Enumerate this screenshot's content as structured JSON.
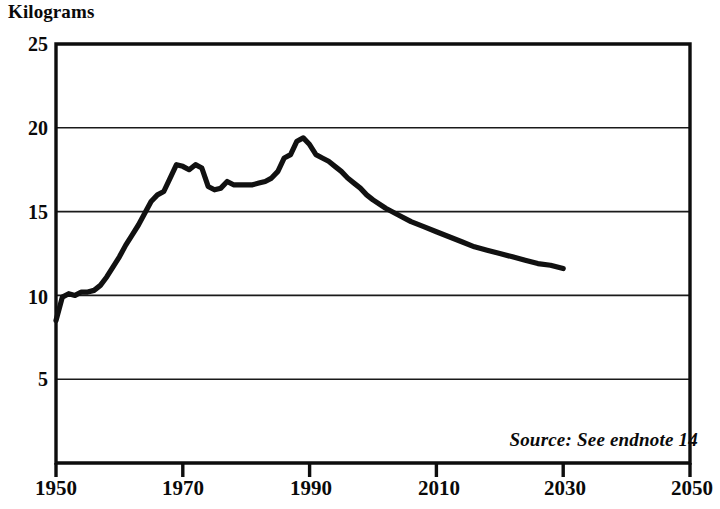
{
  "chart_data": {
    "type": "line",
    "title": "",
    "ylabel": "Kilograms",
    "xlabel": "",
    "ylim": [
      0,
      25
    ],
    "xlim": [
      1950,
      2050
    ],
    "yticks": [
      25,
      20,
      15,
      10,
      5
    ],
    "xticks": [
      1950,
      1970,
      1990,
      2010,
      2030,
      2050
    ],
    "grid": "horizontal",
    "legend": "none",
    "annotations": [
      "Source: See endnote 14"
    ],
    "line_color": "#111111",
    "series": [
      {
        "name": "Kilograms",
        "x": [
          1950,
          1951,
          1952,
          1953,
          1954,
          1955,
          1956,
          1957,
          1958,
          1959,
          1960,
          1961,
          1962,
          1963,
          1964,
          1965,
          1966,
          1967,
          1968,
          1969,
          1970,
          1971,
          1972,
          1973,
          1974,
          1975,
          1976,
          1977,
          1978,
          1979,
          1980,
          1981,
          1982,
          1983,
          1984,
          1985,
          1986,
          1987,
          1988,
          1989,
          1990,
          1991,
          1992,
          1993,
          1994,
          1995,
          1996,
          1997,
          1998,
          1999,
          2000,
          2002,
          2004,
          2006,
          2008,
          2010,
          2012,
          2014,
          2016,
          2018,
          2020,
          2022,
          2024,
          2026,
          2028,
          2030
        ],
        "y": [
          8.5,
          9.9,
          10.1,
          10.0,
          10.2,
          10.2,
          10.3,
          10.6,
          11.1,
          11.7,
          12.3,
          13.0,
          13.6,
          14.2,
          14.9,
          15.6,
          16.0,
          16.2,
          17.0,
          17.8,
          17.7,
          17.5,
          17.8,
          17.6,
          16.5,
          16.3,
          16.4,
          16.8,
          16.6,
          16.6,
          16.6,
          16.6,
          16.7,
          16.8,
          17.0,
          17.4,
          18.2,
          18.4,
          19.2,
          19.4,
          19.0,
          18.4,
          18.2,
          18.0,
          17.7,
          17.4,
          17.0,
          16.7,
          16.4,
          16.0,
          15.7,
          15.2,
          14.8,
          14.4,
          14.1,
          13.8,
          13.5,
          13.2,
          12.9,
          12.7,
          12.5,
          12.3,
          12.1,
          11.9,
          11.8,
          11.6
        ]
      }
    ]
  },
  "axis": {
    "y_title": "Kilograms",
    "y_labels": [
      "25",
      "20",
      "15",
      "10",
      "5"
    ],
    "x_labels": [
      "1950",
      "1970",
      "1990",
      "2010",
      "2030",
      "2050"
    ]
  },
  "note": {
    "source": "Source: See endnote 14"
  }
}
